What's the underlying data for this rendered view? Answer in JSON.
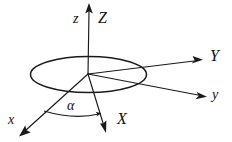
{
  "figure": {
    "background_color": "#ffffff",
    "stroke_color": "#1a1a1a",
    "labels": {
      "z_lower": "z",
      "z_upper": "Z",
      "y_lower": "y",
      "y_upper": "Y",
      "x_lower": "x",
      "x_upper": "X",
      "angle": "α"
    },
    "elements": {
      "origin": "origin-point",
      "plane": "horizontal-plane-ellipse",
      "arc": "alpha-angle-arc"
    }
  }
}
